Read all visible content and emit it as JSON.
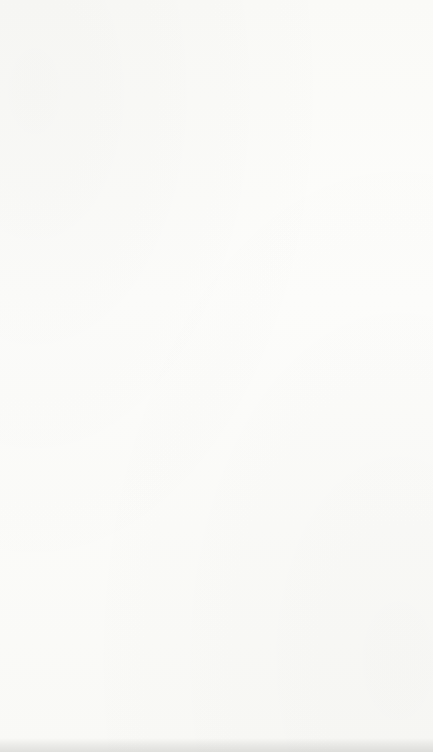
{
  "figure": {
    "caption": "Figure 1",
    "rotation_degrees": 90,
    "background_color": "#fdfdfb",
    "ink_color": "#1b1b1b"
  },
  "time_labels": [
    {
      "id": "t4",
      "text": "t=4 yrs."
    },
    {
      "id": "t3",
      "text": "t=3 yrs."
    },
    {
      "id": "t2",
      "text": "t=2 yrs."
    },
    {
      "id": "t1",
      "text": "t=1 yr."
    }
  ],
  "interval_label": {
    "text": "3 months"
  },
  "entry_label": {
    "text": "Admission"
  },
  "node_labels": {
    "e1_base": "E",
    "e1_sub": "1",
    "e2_base": "E",
    "e2_sub": "2",
    "e3_base": "E",
    "e3_sub": "3"
  },
  "nodes": [
    {
      "id": "n-t4-e1",
      "level": "t=4 yrs.",
      "base": "E",
      "sub": "1",
      "cx": 53,
      "cy": 63,
      "r": 15,
      "fan": false
    },
    {
      "id": "n-t4-e2",
      "level": "t=4 yrs.",
      "base": "E",
      "sub": "2",
      "cx": 103,
      "cy": 63,
      "r": 15,
      "fan": false
    },
    {
      "id": "n-t4-e3",
      "level": "t=4 yrs.",
      "base": "E",
      "sub": "3",
      "cx": 151,
      "cy": 63,
      "r": 15,
      "fan": false
    },
    {
      "id": "n-t3-e1",
      "level": "t=3 yrs.",
      "base": "E",
      "sub": "1",
      "cx": 104,
      "cy": 160,
      "r": 16,
      "fan": false
    },
    {
      "id": "n-t3-e2",
      "level": "t=3 yrs.",
      "base": "E",
      "sub": "2",
      "cx": 155,
      "cy": 160,
      "r": 15,
      "fan": true
    },
    {
      "id": "n-t3-e3",
      "level": "t=3 yrs.",
      "base": "E",
      "sub": "3",
      "cx": 206,
      "cy": 160,
      "r": 16,
      "fan": true
    },
    {
      "id": "n-t2-e1",
      "level": "t=2 yrs.",
      "base": "E",
      "sub": "1",
      "cx": 152,
      "cy": 235,
      "r": 17,
      "fan": false
    },
    {
      "id": "n-t2-e2",
      "level": "t=2 yrs.",
      "base": "E",
      "sub": "2",
      "cx": 205,
      "cy": 235,
      "r": 15,
      "fan": true
    },
    {
      "id": "n-t2-e3",
      "level": "t=2 yrs.",
      "base": "E",
      "sub": "3",
      "cx": 256,
      "cy": 235,
      "r": 16,
      "fan": true
    },
    {
      "id": "n-t1-e1",
      "level": "t=1 yr.",
      "base": "E",
      "sub": "1",
      "cx": 207,
      "cy": 313,
      "r": 17,
      "fan": false
    },
    {
      "id": "n-t1-e2",
      "level": "t=1 yr.",
      "base": "E",
      "sub": "2",
      "cx": 257,
      "cy": 313,
      "r": 15,
      "fan": true
    },
    {
      "id": "n-t1-e3",
      "level": "t=1 yr.",
      "base": "E",
      "sub": "3",
      "cx": 310,
      "cy": 313,
      "r": 16,
      "fan": true
    }
  ],
  "boxes": [
    {
      "id": "box-school-sample",
      "lines": [
        "School",
        "Sample"
      ],
      "x": 228,
      "y": 396,
      "width": 68,
      "height": 135,
      "fan": false
    },
    {
      "id": "box-non-school-sample",
      "lines": [
        "Non-School",
        "Sample"
      ],
      "x": 340,
      "y": 396,
      "width": 68,
      "height": 135,
      "fan": true
    },
    {
      "id": "box-total-sample",
      "lines": [
        "Total Sample",
        "School and",
        "Non-School"
      ],
      "x": 288,
      "y": 570,
      "width": 72,
      "height": 155,
      "fan": false
    }
  ],
  "edges": [
    {
      "from": "n-t3-e1",
      "to": "n-t4-e1"
    },
    {
      "from": "n-t3-e1",
      "to": "n-t4-e2"
    },
    {
      "from": "n-t3-e1",
      "to": "n-t4-e3"
    },
    {
      "from": "n-t2-e1",
      "to": "n-t3-e1"
    },
    {
      "from": "n-t2-e1",
      "to": "n-t3-e2"
    },
    {
      "from": "n-t2-e1",
      "to": "n-t3-e3"
    },
    {
      "from": "n-t1-e1",
      "to": "n-t2-e1"
    },
    {
      "from": "n-t1-e1",
      "to": "n-t2-e2"
    },
    {
      "from": "n-t1-e1",
      "to": "n-t2-e3"
    },
    {
      "from": "box-school-sample",
      "to": "n-t1-e1"
    },
    {
      "from": "box-school-sample",
      "to": "n-t1-e2"
    },
    {
      "from": "box-school-sample",
      "to": "n-t1-e3"
    },
    {
      "from": "box-total-sample",
      "to": "box-school-sample"
    },
    {
      "from": "box-total-sample",
      "to": "box-non-school-sample"
    }
  ]
}
